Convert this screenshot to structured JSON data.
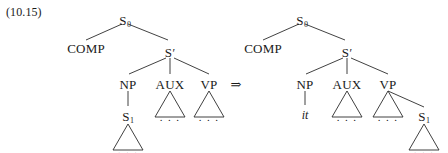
{
  "figure": {
    "example_number": "(10.15)",
    "transform_arrow": "⇒",
    "dots": ". . .",
    "prime_mark": "′"
  },
  "left_tree": {
    "name": "deep-structure-tree",
    "nodes": {
      "s0": "S",
      "s0_sub": "0",
      "comp": "COMP",
      "sbar": "S",
      "np": "NP",
      "aux": "AUX",
      "vp": "VP",
      "s1": "S",
      "s1_sub": "1"
    }
  },
  "right_tree": {
    "name": "surface-structure-tree",
    "nodes": {
      "s0": "S",
      "s0_sub": "0",
      "comp": "COMP",
      "sbar": "S",
      "np": "NP",
      "aux": "AUX",
      "vp": "VP",
      "s1": "S",
      "s1_sub": "1"
    },
    "terminal": {
      "expletive": "it"
    }
  }
}
